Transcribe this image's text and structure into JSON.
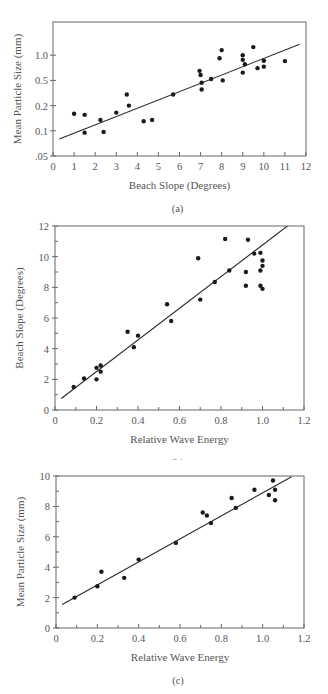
{
  "chart_data": [
    {
      "id": "a",
      "type": "scatter",
      "caption": "(a)",
      "xlabel": "Beach Slope (Degrees)",
      "ylabel": "Mean Particle Size (mm)",
      "xlim": [
        0,
        12
      ],
      "x_ticks": [
        "0",
        "1",
        "2",
        "3",
        "4",
        "5",
        "6",
        "7",
        "8",
        "9",
        "10",
        "11",
        "12"
      ],
      "y_scale": "log",
      "y_ticks": [
        ".05",
        "0.1",
        "0.2",
        "0.5",
        "1.0"
      ],
      "y_tick_values": [
        0.05,
        0.1,
        0.2,
        0.5,
        1.0
      ],
      "grid": false,
      "points": [
        {
          "x": 1.0,
          "y": 0.16
        },
        {
          "x": 1.5,
          "y": 0.155
        },
        {
          "x": 1.5,
          "y": 0.095
        },
        {
          "x": 2.25,
          "y": 0.135
        },
        {
          "x": 2.4,
          "y": 0.097
        },
        {
          "x": 3.0,
          "y": 0.165
        },
        {
          "x": 3.5,
          "y": 0.3
        },
        {
          "x": 3.6,
          "y": 0.2
        },
        {
          "x": 4.3,
          "y": 0.13
        },
        {
          "x": 4.7,
          "y": 0.135
        },
        {
          "x": 5.7,
          "y": 0.3
        },
        {
          "x": 6.95,
          "y": 0.65
        },
        {
          "x": 7.0,
          "y": 0.58
        },
        {
          "x": 7.05,
          "y": 0.46
        },
        {
          "x": 7.05,
          "y": 0.36
        },
        {
          "x": 7.5,
          "y": 0.52
        },
        {
          "x": 7.9,
          "y": 0.92
        },
        {
          "x": 8.0,
          "y": 1.15
        },
        {
          "x": 8.05,
          "y": 0.5
        },
        {
          "x": 9.0,
          "y": 1.0
        },
        {
          "x": 9.0,
          "y": 0.88
        },
        {
          "x": 9.0,
          "y": 0.62
        },
        {
          "x": 9.1,
          "y": 0.78
        },
        {
          "x": 9.5,
          "y": 1.25
        },
        {
          "x": 9.7,
          "y": 0.7
        },
        {
          "x": 10.0,
          "y": 0.86
        },
        {
          "x": 10.0,
          "y": 0.73
        },
        {
          "x": 11.0,
          "y": 0.85
        }
      ],
      "fit_line": {
        "x1": 0.3,
        "y1": 0.08,
        "x2": 11.7,
        "y2": 1.35
      }
    },
    {
      "id": "b",
      "type": "scatter",
      "caption": "(b)",
      "xlabel": "Relative Wave Energy",
      "ylabel": "Beach Slope (Degrees)",
      "xlim": [
        0,
        1.2
      ],
      "ylim": [
        0,
        12
      ],
      "x_ticks": [
        "0",
        "0.2",
        "0.4",
        "0.6",
        "0.8",
        "1.0",
        "1.2"
      ],
      "y_ticks": [
        "0",
        "2",
        "4",
        "6",
        "8",
        "10",
        "12"
      ],
      "grid": false,
      "points": [
        {
          "x": 0.09,
          "y": 1.5
        },
        {
          "x": 0.14,
          "y": 2.05
        },
        {
          "x": 0.2,
          "y": 2.0
        },
        {
          "x": 0.2,
          "y": 2.75
        },
        {
          "x": 0.22,
          "y": 2.5
        },
        {
          "x": 0.22,
          "y": 2.9
        },
        {
          "x": 0.35,
          "y": 5.1
        },
        {
          "x": 0.38,
          "y": 4.1
        },
        {
          "x": 0.4,
          "y": 4.85
        },
        {
          "x": 0.54,
          "y": 6.9
        },
        {
          "x": 0.56,
          "y": 5.8
        },
        {
          "x": 0.69,
          "y": 9.9
        },
        {
          "x": 0.7,
          "y": 7.2
        },
        {
          "x": 0.77,
          "y": 8.35
        },
        {
          "x": 0.82,
          "y": 11.15
        },
        {
          "x": 0.84,
          "y": 9.1
        },
        {
          "x": 0.92,
          "y": 9.0
        },
        {
          "x": 0.92,
          "y": 8.1
        },
        {
          "x": 0.93,
          "y": 11.1
        },
        {
          "x": 0.96,
          "y": 10.2
        },
        {
          "x": 0.99,
          "y": 10.25
        },
        {
          "x": 0.99,
          "y": 9.1
        },
        {
          "x": 0.99,
          "y": 8.1
        },
        {
          "x": 1.0,
          "y": 9.75
        },
        {
          "x": 1.0,
          "y": 9.4
        },
        {
          "x": 1.0,
          "y": 7.9
        }
      ],
      "fit_line": {
        "x1": 0.03,
        "y1": 0.75,
        "x2": 1.12,
        "y2": 12.0
      }
    },
    {
      "id": "c",
      "type": "scatter",
      "caption": "(c)",
      "xlabel": "Relative Wave Energy",
      "ylabel": "Mean Particle Size (mm)",
      "xlim": [
        0,
        1.2
      ],
      "ylim": [
        0,
        10
      ],
      "x_ticks": [
        "0",
        "0.2",
        "0.4",
        "0.6",
        "0.8",
        "1.0",
        "1.2"
      ],
      "y_ticks": [
        "0",
        "2",
        "4",
        "6",
        "8",
        "10"
      ],
      "grid": false,
      "points": [
        {
          "x": 0.09,
          "y": 2.0
        },
        {
          "x": 0.2,
          "y": 2.75
        },
        {
          "x": 0.22,
          "y": 3.7
        },
        {
          "x": 0.33,
          "y": 3.3
        },
        {
          "x": 0.4,
          "y": 4.5
        },
        {
          "x": 0.58,
          "y": 5.6
        },
        {
          "x": 0.71,
          "y": 7.6
        },
        {
          "x": 0.73,
          "y": 7.4
        },
        {
          "x": 0.75,
          "y": 6.9
        },
        {
          "x": 0.85,
          "y": 8.55
        },
        {
          "x": 0.87,
          "y": 7.9
        },
        {
          "x": 0.96,
          "y": 9.1
        },
        {
          "x": 1.03,
          "y": 8.75
        },
        {
          "x": 1.05,
          "y": 9.7
        },
        {
          "x": 1.06,
          "y": 9.1
        },
        {
          "x": 1.06,
          "y": 8.4
        }
      ],
      "fit_line": {
        "x1": 0.03,
        "y1": 1.55,
        "x2": 1.14,
        "y2": 9.95
      }
    }
  ],
  "layout": {
    "charts": [
      {
        "top": 0,
        "height": 215,
        "plot": {
          "left": 53,
          "right": 306,
          "top": 22,
          "bottom": 156
        }
      },
      {
        "top": 215,
        "height": 245,
        "plot": {
          "left": 55,
          "right": 304,
          "top": 11,
          "bottom": 195
        }
      },
      {
        "top": 460,
        "height": 234,
        "plot": {
          "left": 56,
          "right": 304,
          "top": 16,
          "bottom": 168
        }
      }
    ]
  },
  "colors": {
    "axis": "#666666",
    "point": "#1a1a1a",
    "line": "#2a2a2a",
    "text": "#555555"
  }
}
